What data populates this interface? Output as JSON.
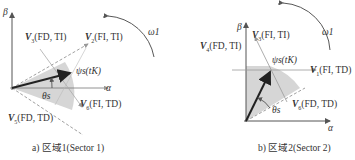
{
  "panels": [
    {
      "id": "a",
      "caption": "a) 区域1(Sector 1)",
      "axes": {
        "x": "α",
        "y": "β"
      },
      "rotation_label": "ω1",
      "flux_label": "ψs(tK)",
      "angle_label": "θs",
      "vectors": [
        {
          "name": "V3",
          "sub": "3",
          "state": "(FD, TI)"
        },
        {
          "name": "V2",
          "sub": "2",
          "state": "(FI, TI)"
        },
        {
          "name": "V6",
          "sub": "6",
          "state": "(FI, TD)"
        },
        {
          "name": "V5",
          "sub": "5",
          "state": "(FD, TD)"
        }
      ]
    },
    {
      "id": "b",
      "caption": "b) 区域2(Sector 2)",
      "axes": {
        "x": "α",
        "y": "β"
      },
      "rotation_label": "ω1",
      "flux_label": "ψs(tK)",
      "angle_label": "θs",
      "vectors": [
        {
          "name": "V4",
          "sub": "4",
          "state": "(FD, TI)"
        },
        {
          "name": "V3",
          "sub": "3",
          "state": "(FI, TI)"
        },
        {
          "name": "V1",
          "sub": "1",
          "state": "(FI, TD)"
        },
        {
          "name": "V6",
          "sub": "6",
          "state": "(FD, TD)"
        }
      ]
    }
  ]
}
